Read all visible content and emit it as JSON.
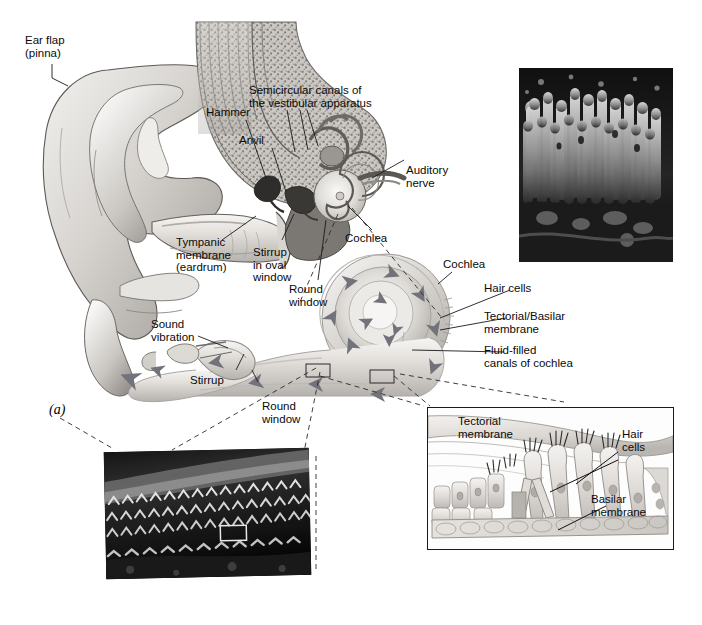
{
  "figure": {
    "panel_letter": "(a)",
    "title_visible": false,
    "background_color": "#ffffff",
    "ink_color": "#0a0a0a"
  },
  "labels": {
    "ear_flap": "Ear flap\n(pinna)",
    "hammer": "Hammer",
    "anvil": "Anvil",
    "semicircular": "Semicircular canals of\nthe vestibular apparatus",
    "auditory_nerve": "Auditory\nnerve",
    "tympanic": "Tympanic\nmembrane\n(eardrum)",
    "stirrup_oval": "Stirrup\nin oval\nwindow",
    "round_window_top": "Round\nwindow",
    "cochlea_main": "Cochlea",
    "cochlea_uncoiled": "Cochlea",
    "hair_cells_right": "Hair cells",
    "tectorial_basilar": "Tectorial/Basilar\nmembrane",
    "fluid_filled": "Fluid-filled\ncanals of cochlea",
    "sound_vibration": "Sound\nvibration",
    "stirrup": "Stirrup",
    "round_window_bottom": "Round\nwindow"
  },
  "inset_right": {
    "tectorial_membrane": "Tectorial\nmembrane",
    "hair_cells": "Hair\ncells",
    "basilar_membrane": "Basilar\nmembrane"
  },
  "micrographs": {
    "top_right": {
      "name": "hair-cell-stereocilia-sem",
      "x": 519,
      "y": 68,
      "w": 154,
      "h": 194
    },
    "bottom_left": {
      "name": "organ-of-corti-hair-cell-rows-sem",
      "x": 105,
      "y": 450,
      "w": 205,
      "h": 127
    }
  },
  "colors": {
    "line": "#1a1a1a",
    "arrow": "#707078",
    "tissue_light": "#e8e6e3",
    "tissue_mid": "#c3c0bc",
    "tissue_dark": "#8e8b87",
    "bone_speckle": "#a8a5a0"
  }
}
